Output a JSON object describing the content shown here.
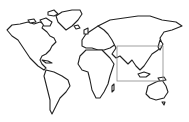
{
  "map": {
    "type": "world-outline",
    "background": "#ffffff",
    "stroke_color": "#222222",
    "highlight_region": {
      "label": "Asia",
      "x": 117,
      "y": 46,
      "width": 46,
      "height": 35,
      "color": "#888888"
    }
  }
}
